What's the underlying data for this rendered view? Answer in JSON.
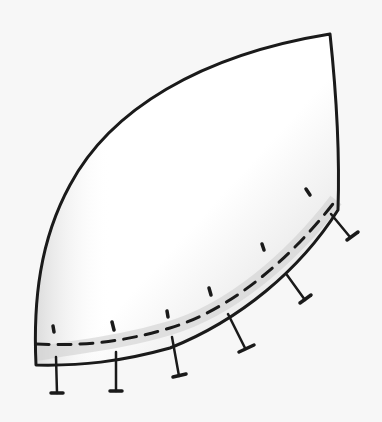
{
  "drawing": {
    "subject": "curved pattern piece with dashed seam line and notch marks",
    "background_color": "#f7f7f7",
    "ink_color": "#1a1a1a",
    "fill_color": "#ffffff",
    "shade_color": "#d4d4d4",
    "outline_path": "M36,365 C33,300 40,240 70,185 C110,110 200,55 330,34 C336,90 340,150 338,210 C300,270 240,320 170,348 C120,362 80,366 36,365 Z",
    "seam_path": "M36,344 C80,346 120,343 170,328 C230,310 290,260 336,200",
    "notches": [
      {
        "x1": 56,
        "y1": 357,
        "x2": 57,
        "y2": 393,
        "bar": [
          51,
          393,
          63,
          393
        ]
      },
      {
        "x1": 116,
        "y1": 352,
        "x2": 116,
        "y2": 391,
        "bar": [
          110,
          391,
          122,
          391
        ]
      },
      {
        "x1": 172,
        "y1": 337,
        "x2": 179,
        "y2": 376,
        "bar": [
          173,
          377,
          186,
          374
        ]
      },
      {
        "x1": 228,
        "y1": 314,
        "x2": 245,
        "y2": 348,
        "bar": [
          239,
          352,
          254,
          345
        ]
      },
      {
        "x1": 287,
        "y1": 275,
        "x2": 305,
        "y2": 300,
        "bar": [
          300,
          303,
          311,
          295
        ]
      },
      {
        "x1": 331,
        "y1": 214,
        "x2": 350,
        "y2": 237,
        "bar": [
          347,
          240,
          358,
          232
        ]
      }
    ],
    "ticks": [
      {
        "x1": 53,
        "y1": 326,
        "x2": 54,
        "y2": 332
      },
      {
        "x1": 112,
        "y1": 322,
        "x2": 114,
        "y2": 330
      },
      {
        "x1": 167,
        "y1": 311,
        "x2": 168,
        "y2": 317
      },
      {
        "x1": 209,
        "y1": 288,
        "x2": 211,
        "y2": 295
      },
      {
        "x1": 262,
        "y1": 244,
        "x2": 264,
        "y2": 250
      },
      {
        "x1": 306,
        "y1": 189,
        "x2": 310,
        "y2": 195
      }
    ]
  }
}
